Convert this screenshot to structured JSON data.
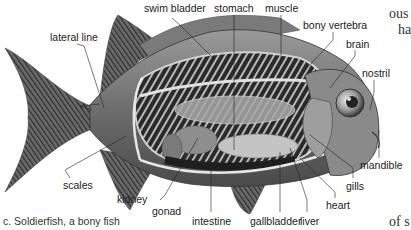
{
  "figure": {
    "caption": "c. Soldierfish, a bony fish",
    "labels": {
      "swim_bladder": "swim bladder",
      "stomach": "stomach",
      "muscle": "muscle",
      "bony_vertebra": "bony vertebra",
      "brain": "brain",
      "nostril": "nostril",
      "lateral_line": "lateral line",
      "scales": "scales",
      "kidney": "kidney",
      "gonad": "gonad",
      "intestine": "intestine",
      "gallbladder": "gallbladder",
      "liver": "liver",
      "heart": "heart",
      "gills": "gills",
      "mandible": "mandible"
    }
  },
  "adjacent_text": {
    "top_right_1": "ous",
    "top_right_2": "ha",
    "bottom_right": "of s"
  }
}
